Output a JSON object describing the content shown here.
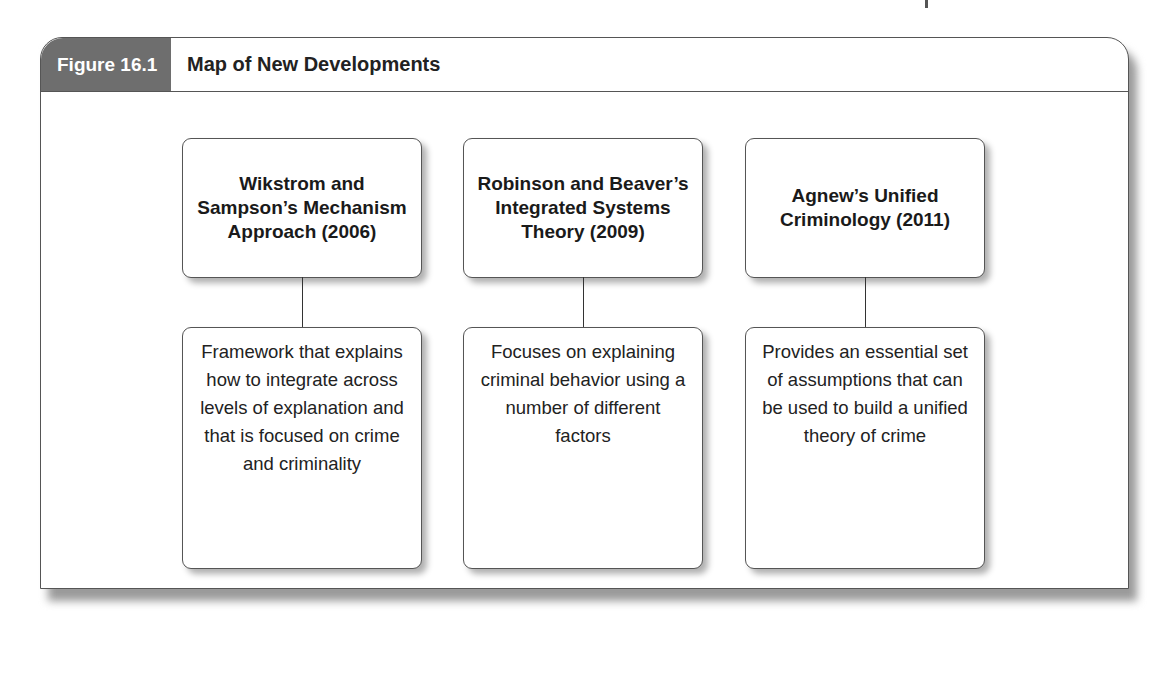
{
  "figure": {
    "label": "Figure 16.1",
    "title": "Map of New Developments"
  },
  "colors": {
    "label_bg": "#6e6e6e",
    "border": "#555555",
    "shadow": "#b0b0b0"
  },
  "columns": [
    {
      "heading": "Wikstrom and Sampson’s Mechanism Approach (2006)",
      "description": "Framework that explains how to integrate across levels of explanation and that is focused on crime and criminality"
    },
    {
      "heading": "Robinson and Beaver’s Integrated Systems Theory (2009)",
      "description": "Focuses on explaining criminal behavior using a number of different factors"
    },
    {
      "heading": "Agnew’s Unified Criminology (2011)",
      "description": "Provides an essential set of assumptions that can be used to build a unified theory of crime"
    }
  ]
}
